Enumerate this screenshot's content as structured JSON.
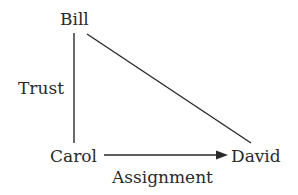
{
  "diagram": {
    "type": "relationship-diagram",
    "nodes": [
      {
        "id": "bill",
        "label": "Bill"
      },
      {
        "id": "carol",
        "label": "Carol"
      },
      {
        "id": "david",
        "label": "David"
      }
    ],
    "edges": [
      {
        "from": "bill",
        "to": "carol",
        "label": "Trust",
        "directed": false
      },
      {
        "from": "carol",
        "to": "david",
        "label": "Assignment",
        "directed": true
      },
      {
        "from": "bill",
        "to": "david",
        "label": "",
        "directed": false
      }
    ],
    "colors": {
      "line": "#2a2a2a",
      "text": "#2a2a2a",
      "background": "#ffffff"
    }
  }
}
